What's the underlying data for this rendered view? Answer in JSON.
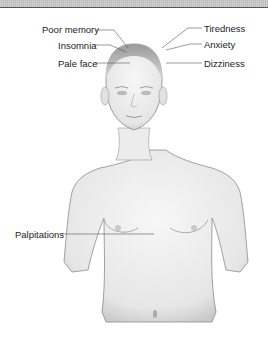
{
  "figure": {
    "labels_left": [
      {
        "text": "Poor memory"
      },
      {
        "text": "Insomnia"
      },
      {
        "text": "Pale face"
      },
      {
        "text": "Palpitations"
      }
    ],
    "labels_right": [
      {
        "text": "Tiredness"
      },
      {
        "text": "Anxiety"
      },
      {
        "text": "Dizziness"
      }
    ]
  }
}
